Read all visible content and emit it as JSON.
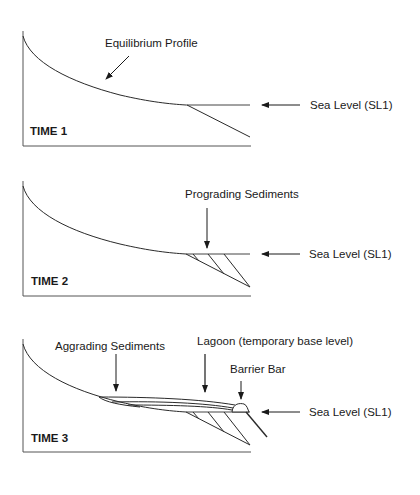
{
  "figure": {
    "panels": [
      {
        "time_label": "TIME 1",
        "annotations": {
          "profile_label": "Equilibrium Profile",
          "sea_level_label": "Sea Level (SL1)"
        }
      },
      {
        "time_label": "TIME 2",
        "annotations": {
          "sediment_label": "Prograding Sediments",
          "sea_level_label": "Sea Level (SL1)"
        }
      },
      {
        "time_label": "TIME 3",
        "annotations": {
          "aggrading_label": "Aggrading Sediments",
          "lagoon_label": "Lagoon (temporary base level)",
          "barrier_label": "Barrier Bar",
          "sea_level_label": "Sea Level (SL1)"
        }
      }
    ]
  },
  "colors": {
    "line": "#2a2a2a",
    "frame": "#555555",
    "text": "#1a1a1a",
    "background": "#ffffff"
  }
}
